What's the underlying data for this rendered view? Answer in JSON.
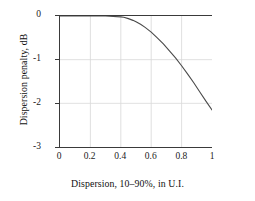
{
  "chart_data": {
    "type": "line",
    "title": "",
    "xlabel": "Dispersion, 10–90%, in U.I.",
    "ylabel": "Dispersion penalty, dB",
    "xlim": [
      0,
      1
    ],
    "ylim": [
      -3,
      0
    ],
    "xticks": [
      "0",
      "0.2",
      "0.4",
      "0.6",
      "0.8",
      "1"
    ],
    "xtick_values": [
      0,
      0.2,
      0.4,
      0.6,
      0.8,
      1
    ],
    "yticks": [
      "0",
      "-1",
      "-2",
      "-3"
    ],
    "ytick_values": [
      0,
      -1,
      -2,
      -3
    ],
    "grid": "both",
    "legend": "none",
    "line_color": "#4a4a4a",
    "grid_color": "#d8d8d8",
    "axis_color": "#3a3a3a",
    "series": [
      {
        "name": "Dispersion penalty",
        "x": [
          0.0,
          0.05,
          0.1,
          0.15,
          0.2,
          0.25,
          0.3,
          0.35,
          0.4,
          0.42,
          0.45,
          0.48,
          0.5,
          0.53,
          0.56,
          0.6,
          0.64,
          0.68,
          0.72,
          0.76,
          0.8,
          0.84,
          0.88,
          0.92,
          0.96,
          1.0
        ],
        "values": [
          0.0,
          0.0,
          0.0,
          0.0,
          0.0,
          0.0,
          0.0,
          -0.01,
          -0.02,
          -0.03,
          -0.06,
          -0.1,
          -0.13,
          -0.19,
          -0.26,
          -0.37,
          -0.5,
          -0.64,
          -0.8,
          -0.96,
          -1.14,
          -1.33,
          -1.53,
          -1.74,
          -1.95,
          -2.15
        ]
      }
    ]
  }
}
